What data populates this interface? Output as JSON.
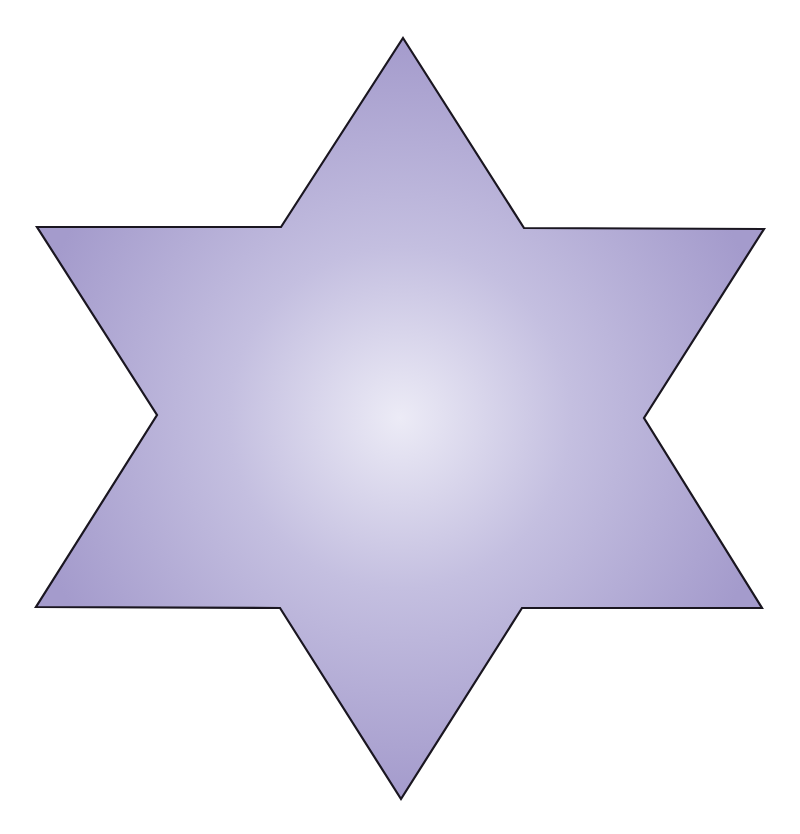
{
  "figure": {
    "shape": "six-pointed star (hexagram)",
    "fill_center_color": "#ecebf6",
    "fill_mid_color": "#c4bfe0",
    "fill_edge_color": "#a49bcc",
    "stroke_color": "#1a1620",
    "vertices": [
      [
        403,
        38
      ],
      [
        524,
        228
      ],
      [
        764,
        229
      ],
      [
        644,
        418
      ],
      [
        762,
        608
      ],
      [
        522,
        608
      ],
      [
        401,
        799
      ],
      [
        280,
        608
      ],
      [
        36,
        607
      ],
      [
        157,
        415
      ],
      [
        37,
        227
      ],
      [
        281,
        227
      ]
    ]
  }
}
